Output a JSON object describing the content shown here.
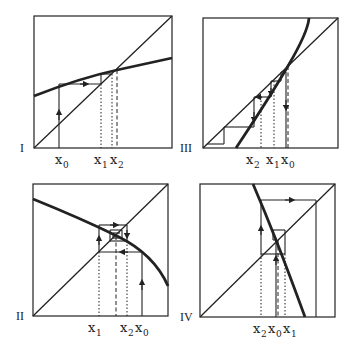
{
  "figure": {
    "panels": [
      {
        "id": "I",
        "label": "I",
        "behavior": "monotone convergence",
        "xlabels": [
          "x",
          "x",
          "x"
        ],
        "subs": [
          "0",
          "1",
          "2"
        ]
      },
      {
        "id": "III",
        "label": "III",
        "behavior": "monotone divergence",
        "xlabels": [
          "x",
          "x",
          "x"
        ],
        "subs": [
          "2",
          "1",
          "0"
        ]
      },
      {
        "id": "II",
        "label": "II",
        "behavior": "oscillating convergence",
        "xlabels": [
          "x",
          "x",
          "x"
        ],
        "subs": [
          "1",
          "2",
          "0"
        ]
      },
      {
        "id": "IV",
        "label": "IV",
        "behavior": "oscillating divergence",
        "xlabels": [
          "x",
          "x",
          "x"
        ],
        "subs": [
          "2",
          "0",
          "1"
        ]
      }
    ],
    "colors": {
      "ink": "#222222",
      "background": "#ffffff"
    }
  }
}
